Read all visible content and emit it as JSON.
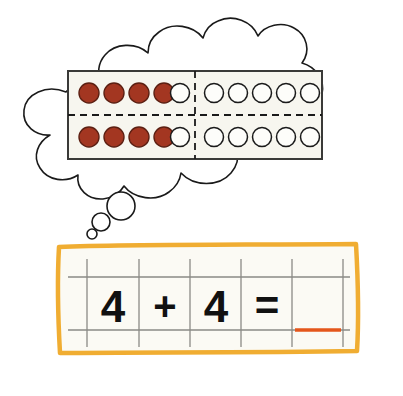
{
  "canvas": {
    "width": 403,
    "height": 396,
    "background": "#ffffff"
  },
  "thought_bubble": {
    "name": "thought-bubble",
    "outline_color": "#1a1a1a",
    "fill_color": "#ffffff",
    "tail_bubbles": [
      {
        "label": "large-tail-bubble",
        "cx": 121,
        "cy": 206,
        "r": 14
      },
      {
        "label": "medium-tail-bubble",
        "cx": 101,
        "cy": 222,
        "r": 9
      },
      {
        "label": "small-tail-bubble",
        "cx": 92,
        "cy": 234,
        "r": 5
      }
    ]
  },
  "ten_frame": {
    "name": "double-ten-frame",
    "border_color": "#3a3a38",
    "fill_color": "#f7f6ef",
    "divider_color": "#1a1a1a",
    "counter_filled_color": "#a33621",
    "counter_filled_stroke": "#5c1f12",
    "counter_empty_fill": "#fdfdfa",
    "counter_empty_stroke": "#1a1a1a",
    "rows": 2,
    "columns_per_half": 5,
    "halves": [
      {
        "label": "left-ten-frame",
        "filled_per_row": 4,
        "empty_per_row": 1,
        "total_filled": 8,
        "total_cells": 10
      },
      {
        "label": "right-ten-frame",
        "filled_per_row": 0,
        "empty_per_row": 5,
        "total_filled": 0,
        "total_cells": 10
      }
    ]
  },
  "worksheet": {
    "name": "equation-worksheet",
    "border_color": "#f0ad32",
    "paper_color": "#fbfaf4",
    "grid_color": "#8a8a86",
    "answer_line_color": "#e4561b",
    "equation": {
      "addend_one": "4",
      "operator": "+",
      "addend_two": "4",
      "equals": "=",
      "answer": ""
    },
    "cells": [
      {
        "name": "cell-addend-one",
        "text": "4"
      },
      {
        "name": "cell-operator-plus",
        "text": "+"
      },
      {
        "name": "cell-addend-two",
        "text": "4"
      },
      {
        "name": "cell-equals",
        "text": "="
      },
      {
        "name": "cell-answer-blank",
        "text": ""
      }
    ],
    "digit_color": "#111111"
  },
  "accessibility": {
    "summary": "A thought bubble shows a double ten-frame with four red counters in each row on the left frame and empty circles elsewhere. Below, a worksheet reads 4 + 4 = with a blank answer line."
  }
}
